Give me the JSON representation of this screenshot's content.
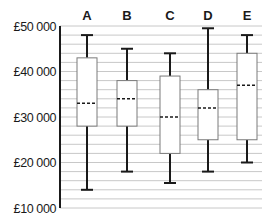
{
  "chart_data": {
    "type": "box",
    "title": "",
    "xlabel": "",
    "ylabel": "",
    "ylim": [
      10000,
      50000
    ],
    "y_ticks": [
      10000,
      20000,
      30000,
      40000,
      50000
    ],
    "y_tick_labels": [
      "£10 000",
      "£20 000",
      "£30 000",
      "£40 000",
      "£50 000"
    ],
    "minor_grid_step": 2000,
    "grid": true,
    "legend": null,
    "categories": [
      "A",
      "B",
      "C",
      "D",
      "E"
    ],
    "series": [
      {
        "name": "A",
        "min": 14000,
        "q1": 28000,
        "median": 33000,
        "q3": 43000,
        "max": 48000
      },
      {
        "name": "B",
        "min": 18000,
        "q1": 28000,
        "median": 34000,
        "q3": 38000,
        "max": 45000
      },
      {
        "name": "C",
        "min": 15500,
        "q1": 22000,
        "median": 30000,
        "q3": 39000,
        "max": 44000
      },
      {
        "name": "D",
        "min": 18000,
        "q1": 25000,
        "median": 32000,
        "q3": 36000,
        "max": 49500
      },
      {
        "name": "E",
        "min": 20000,
        "q1": 25000,
        "median": 37000,
        "q3": 44000,
        "max": 48000
      }
    ]
  },
  "colors": {
    "axis": "#1a1a1a",
    "grid": "#c8c8c8",
    "box_stroke": "#7a7a7a",
    "whisker": "#1a1a1a",
    "median": "#1a1a1a"
  }
}
